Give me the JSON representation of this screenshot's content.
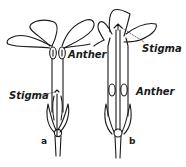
{
  "figure": {
    "flowers": [
      {
        "id": "a",
        "letter": "a",
        "labels": {
          "upper": "Anther",
          "lower": "Stigma"
        }
      },
      {
        "id": "b",
        "letter": "b",
        "labels": {
          "upper": "Stigma",
          "lower": "Anther"
        }
      }
    ],
    "colors": {
      "ink": "#1a1a1a",
      "paper": "#ffffff"
    }
  }
}
